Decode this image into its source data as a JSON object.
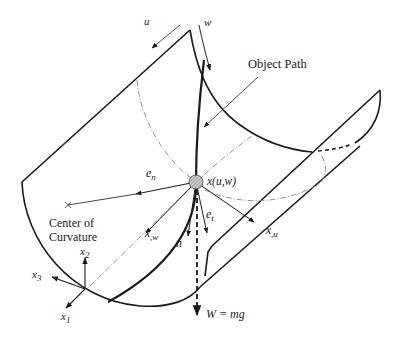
{
  "figure": {
    "labels": {
      "u": "u",
      "w": "w",
      "object_path": "Object Path",
      "e_n": "e",
      "e_n_sub": "n",
      "position": "x(u,w)",
      "e_t": "e",
      "e_t_sub": "t",
      "x_w": "x",
      "x_w_sub": ",w",
      "x_u": "x",
      "x_u_sub": ",u",
      "n": "n",
      "center_line1": "Center of",
      "center_line2": "Curvature",
      "x1": "x",
      "x1_sub": "1",
      "x2": "x",
      "x2_sub": "2",
      "x3": "x",
      "x3_sub": "3",
      "weight": "W = mg"
    },
    "colors": {
      "stroke": "#1a1a1a",
      "thin": "#444444",
      "ball_fill": "#b5b5b5",
      "dashdot": "#888888"
    }
  }
}
